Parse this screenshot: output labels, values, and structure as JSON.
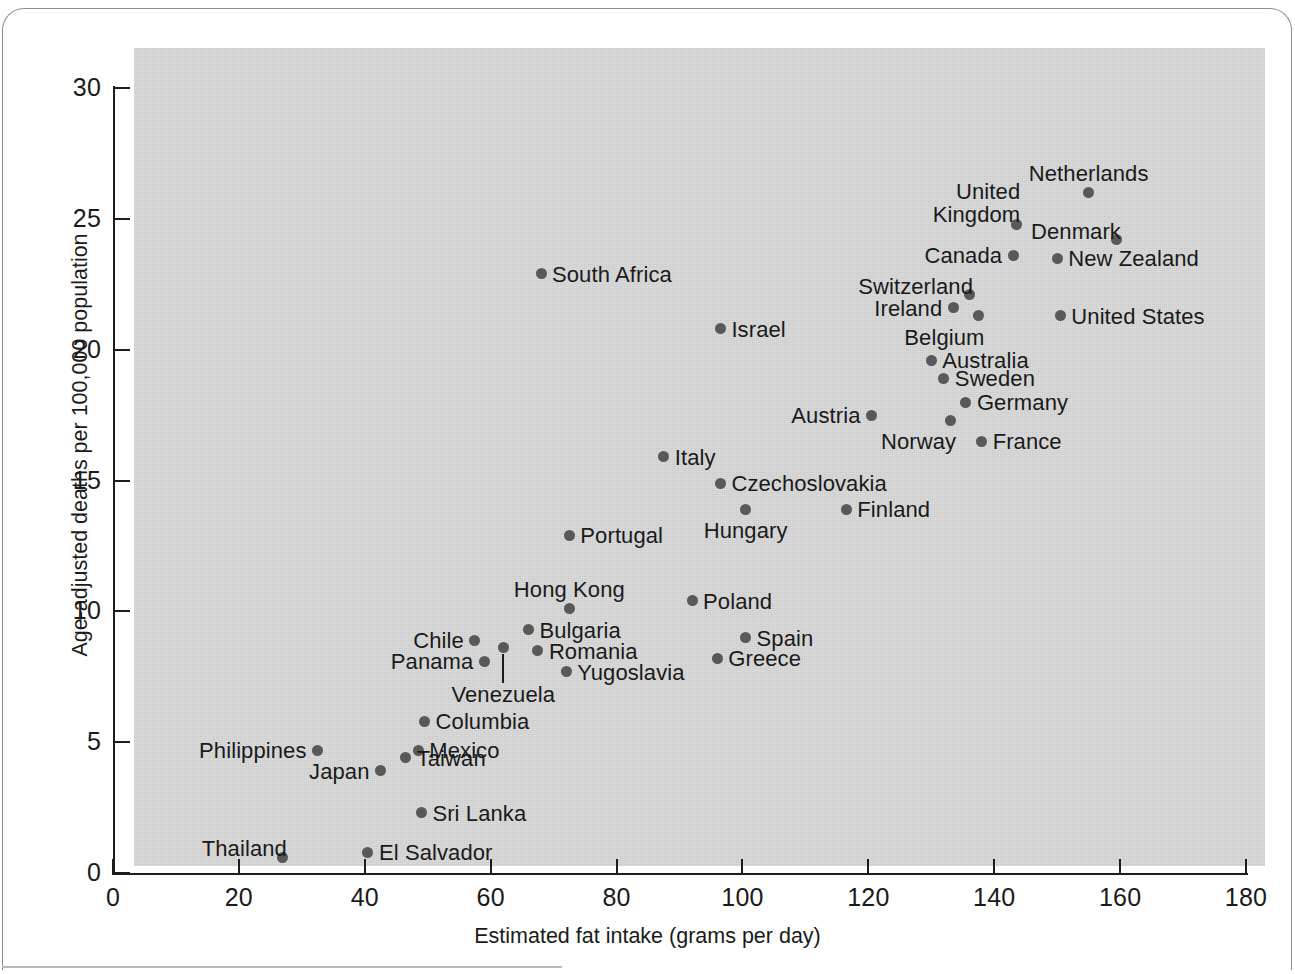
{
  "chart_data": {
    "type": "scatter",
    "title": "",
    "xlabel": "Estimated fat intake (grams per day)",
    "ylabel": "Age-adjusted deaths per 100,000 population",
    "xlim": [
      0,
      180
    ],
    "ylim": [
      0,
      30
    ],
    "xticks": [
      0,
      20,
      40,
      60,
      80,
      100,
      120,
      140,
      160,
      180
    ],
    "yticks": [
      0,
      5,
      10,
      15,
      20,
      25,
      30
    ],
    "grid": false,
    "legend": "none",
    "point_color": "#595959",
    "panel_color": "#d4d4d4",
    "points": [
      {
        "label": "Netherlands",
        "x": 155.0,
        "y": 26.0,
        "pos": "above"
      },
      {
        "label": "United\nKingdom",
        "x": 143.5,
        "y": 24.8,
        "pos": "above-left"
      },
      {
        "label": "Denmark",
        "x": 159.5,
        "y": 24.2,
        "pos": "above-left"
      },
      {
        "label": "Canada",
        "x": 143.0,
        "y": 23.6,
        "pos": "left"
      },
      {
        "label": "New Zealand",
        "x": 150.0,
        "y": 23.5,
        "pos": "right"
      },
      {
        "label": "South Africa",
        "x": 68.0,
        "y": 22.9,
        "pos": "right"
      },
      {
        "label": "Switzerland",
        "x": 136.0,
        "y": 22.1,
        "pos": "above-left"
      },
      {
        "label": "Ireland",
        "x": 133.5,
        "y": 21.6,
        "pos": "left"
      },
      {
        "label": "Belgium",
        "x": 137.5,
        "y": 21.3,
        "pos": "below-left"
      },
      {
        "label": "United States",
        "x": 150.5,
        "y": 21.3,
        "pos": "right"
      },
      {
        "label": "Israel",
        "x": 96.5,
        "y": 20.8,
        "pos": "right"
      },
      {
        "label": "Australia",
        "x": 130.0,
        "y": 19.6,
        "pos": "right"
      },
      {
        "label": "Sweden",
        "x": 132.0,
        "y": 18.9,
        "pos": "right"
      },
      {
        "label": "Germany",
        "x": 135.5,
        "y": 18.0,
        "pos": "right"
      },
      {
        "label": "Austria",
        "x": 120.5,
        "y": 17.5,
        "pos": "left"
      },
      {
        "label": "Norway",
        "x": 133.0,
        "y": 17.3,
        "pos": "below-left"
      },
      {
        "label": "France",
        "x": 138.0,
        "y": 16.5,
        "pos": "right"
      },
      {
        "label": "Italy",
        "x": 87.5,
        "y": 15.9,
        "pos": "right"
      },
      {
        "label": "Czechoslovakia",
        "x": 96.5,
        "y": 14.9,
        "pos": "right"
      },
      {
        "label": "Hungary",
        "x": 100.5,
        "y": 13.9,
        "pos": "below"
      },
      {
        "label": "Finland",
        "x": 116.5,
        "y": 13.9,
        "pos": "right"
      },
      {
        "label": "Portugal",
        "x": 72.5,
        "y": 12.9,
        "pos": "right"
      },
      {
        "label": "Poland",
        "x": 92.0,
        "y": 10.4,
        "pos": "right"
      },
      {
        "label": "Hong Kong",
        "x": 72.5,
        "y": 10.1,
        "pos": "above"
      },
      {
        "label": "Bulgaria",
        "x": 66.0,
        "y": 9.3,
        "pos": "right"
      },
      {
        "label": "Spain",
        "x": 100.5,
        "y": 9.0,
        "pos": "right"
      },
      {
        "label": "Chile",
        "x": 57.5,
        "y": 8.9,
        "pos": "left"
      },
      {
        "label": "Venezuela",
        "x": 62.0,
        "y": 8.6,
        "pos": "leader-below"
      },
      {
        "label": "Romania",
        "x": 67.5,
        "y": 8.5,
        "pos": "right"
      },
      {
        "label": "Greece",
        "x": 96.0,
        "y": 8.2,
        "pos": "right"
      },
      {
        "label": "Panama",
        "x": 59.0,
        "y": 8.1,
        "pos": "left"
      },
      {
        "label": "Yugoslavia",
        "x": 72.0,
        "y": 7.7,
        "pos": "right"
      },
      {
        "label": "Columbia",
        "x": 49.5,
        "y": 5.8,
        "pos": "right"
      },
      {
        "label": "Philippines",
        "x": 32.5,
        "y": 4.7,
        "pos": "left"
      },
      {
        "label": "Mexico",
        "x": 48.5,
        "y": 4.7,
        "pos": "right"
      },
      {
        "label": "Taiwan",
        "x": 46.5,
        "y": 4.4,
        "pos": "right"
      },
      {
        "label": "Japan",
        "x": 42.5,
        "y": 3.9,
        "pos": "left"
      },
      {
        "label": "Sri Lanka",
        "x": 49.0,
        "y": 2.3,
        "pos": "right"
      },
      {
        "label": "El Salvador",
        "x": 40.5,
        "y": 0.8,
        "pos": "right"
      },
      {
        "label": "Thailand",
        "x": 27.0,
        "y": 0.6,
        "pos": "above-left"
      }
    ]
  },
  "axes": {
    "x_title": "Estimated fat intake (grams per day)",
    "y_title": "Age-adjusted deaths per 100,000 population",
    "x_tick_labels": [
      "0",
      "20",
      "40",
      "60",
      "80",
      "100",
      "120",
      "140",
      "160",
      "180"
    ],
    "y_tick_labels": [
      "0",
      "5",
      "10",
      "15",
      "20",
      "25",
      "30"
    ]
  }
}
